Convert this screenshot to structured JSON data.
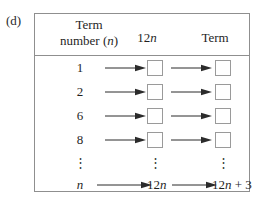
{
  "part_label": "(d)",
  "table": {
    "headers": {
      "col1_line1": "Term",
      "col1_line2_prefix": "number (",
      "col1_line2_var": "n",
      "col1_line2_suffix": ")",
      "col2_prefix": "12",
      "col2_var": "n",
      "col3": "Term"
    },
    "rows": [
      {
        "term_number": "1",
        "box1": "",
        "box2": ""
      },
      {
        "term_number": "2",
        "box1": "",
        "box2": ""
      },
      {
        "term_number": "6",
        "box1": "",
        "box2": ""
      },
      {
        "term_number": "8",
        "box1": "",
        "box2": ""
      }
    ],
    "ellipsis": {
      "col1": "⋮",
      "col2": "⋮",
      "col3": "⋮"
    },
    "general_row": {
      "term_number_var": "n",
      "expr1_prefix": "12",
      "expr1_var": "n",
      "expr2_prefix": "12",
      "expr2_var": "n",
      "expr2_suffix": " + 3"
    },
    "arrow_label": "right-arrow"
  },
  "colors": {
    "border": "#8f8f8f",
    "box_border": "#9a9a9a",
    "text": "#1f1f1f",
    "arrow": "#2b2b2b",
    "background": "#ffffff"
  }
}
